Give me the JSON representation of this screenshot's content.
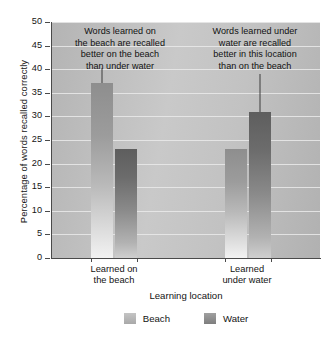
{
  "chart_data": {
    "type": "bar",
    "title": "",
    "xlabel": "Learning location",
    "ylabel": "Percentage of words recalled correctly",
    "categories": [
      "Learned on\nthe beach",
      "Learned\nunder water"
    ],
    "series": [
      {
        "name": "Beach",
        "values": [
          37,
          23
        ],
        "color": "#b9b9b9"
      },
      {
        "name": "Water",
        "values": [
          23,
          31
        ],
        "color": "#8a8a8a"
      }
    ],
    "ylim": [
      0,
      50
    ],
    "yticks": [
      0,
      5,
      10,
      15,
      20,
      25,
      30,
      35,
      40,
      45,
      50
    ],
    "ytick_labels": [
      "0",
      "5",
      "10",
      "15",
      "20",
      "25",
      "30",
      "35",
      "40",
      "45",
      "50"
    ],
    "grid": true,
    "legend_position": "bottom",
    "annotations": [
      "Words learned on\nthe beach are recalled\nbetter on the beach\nthan under water",
      "Words learned under\nwater are recalled\nbetter in this location\nthan on the beach"
    ]
  },
  "legend": {
    "items": [
      {
        "label": "Beach"
      },
      {
        "label": "Water"
      }
    ]
  }
}
